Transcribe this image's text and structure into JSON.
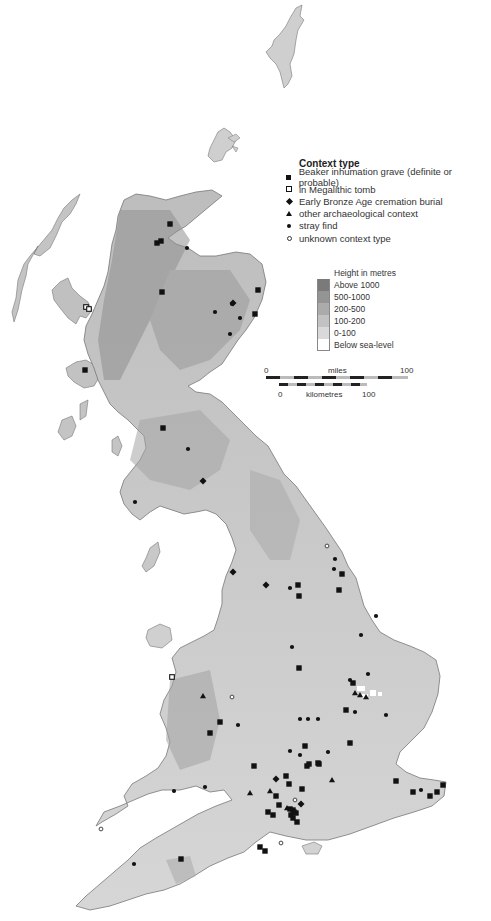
{
  "legend": {
    "title": "Context type",
    "items": [
      {
        "symbol": "filled-square",
        "label": "Beaker inhumation grave (definite or probable)"
      },
      {
        "symbol": "open-square",
        "label": "in Megalithic tomb"
      },
      {
        "symbol": "filled-diamond",
        "label": "Early Bronze Age cremation burial"
      },
      {
        "symbol": "filled-triangle",
        "label": "other archaeological context"
      },
      {
        "symbol": "filled-dot",
        "label": "stray find"
      },
      {
        "symbol": "open-dot",
        "label": "unknown context type"
      }
    ]
  },
  "height_legend": {
    "title": "Height in metres",
    "bands": [
      {
        "label": "Above 1000",
        "color": "#7a7a7a"
      },
      {
        "label": "500-1000",
        "color": "#949494"
      },
      {
        "label": "200-500",
        "color": "#ababab"
      },
      {
        "label": "100-200",
        "color": "#c2c2c2"
      },
      {
        "label": "0-100",
        "color": "#d9d9d9"
      },
      {
        "label": "Below sea-level",
        "color": "#ffffff"
      }
    ]
  },
  "scale_bar": {
    "miles_label": "miles",
    "miles_start": "0",
    "miles_end": "100",
    "km_label": "kilometres",
    "km_start": "0",
    "km_end": "100"
  },
  "colors": {
    "land": "#d3d3d3",
    "highland": "#a8a8a8",
    "coast": "#777777",
    "marker": "#111111",
    "sea": "#ffffff"
  },
  "markers": {
    "beaker_inhumation": [
      [
        170,
        224
      ],
      [
        157,
        243
      ],
      [
        161,
        241
      ],
      [
        162,
        292
      ],
      [
        258,
        290
      ],
      [
        255,
        314
      ],
      [
        85,
        370
      ],
      [
        163,
        428
      ],
      [
        299,
        596
      ],
      [
        342,
        574
      ],
      [
        339,
        590
      ],
      [
        299,
        668
      ],
      [
        353,
        683
      ],
      [
        346,
        710
      ],
      [
        350,
        743
      ],
      [
        305,
        746
      ],
      [
        307,
        766
      ],
      [
        309,
        764
      ],
      [
        318,
        763
      ],
      [
        319,
        764
      ],
      [
        302,
        789
      ],
      [
        254,
        766
      ],
      [
        289,
        784
      ],
      [
        286,
        776
      ],
      [
        276,
        796
      ],
      [
        268,
        812
      ],
      [
        279,
        805
      ],
      [
        273,
        815
      ],
      [
        290,
        809
      ],
      [
        293,
        810
      ],
      [
        294,
        812
      ],
      [
        296,
        813
      ],
      [
        291,
        815
      ],
      [
        293,
        818
      ],
      [
        297,
        822
      ],
      [
        396,
        781
      ],
      [
        413,
        792
      ],
      [
        430,
        796
      ],
      [
        437,
        792
      ],
      [
        443,
        785
      ],
      [
        260,
        847
      ],
      [
        265,
        851
      ],
      [
        181,
        859
      ],
      [
        298,
        585
      ],
      [
        210,
        733
      ],
      [
        220,
        722
      ]
    ],
    "megalithic_tomb": [
      [
        86,
        307
      ],
      [
        89,
        309
      ],
      [
        172,
        677
      ]
    ],
    "cremation": [
      [
        203,
        481
      ],
      [
        233,
        572
      ],
      [
        301,
        804
      ],
      [
        276,
        779
      ],
      [
        233,
        303
      ],
      [
        266,
        585
      ]
    ],
    "other_context": [
      [
        355,
        693
      ],
      [
        360,
        695
      ],
      [
        366,
        697
      ],
      [
        203,
        696
      ],
      [
        332,
        780
      ],
      [
        250,
        793
      ],
      [
        287,
        808
      ],
      [
        270,
        791
      ]
    ],
    "stray_find": [
      [
        187,
        248
      ],
      [
        188,
        449
      ],
      [
        135,
        502
      ],
      [
        335,
        559
      ],
      [
        334,
        569
      ],
      [
        290,
        588
      ],
      [
        376,
        616
      ],
      [
        292,
        647
      ],
      [
        361,
        635
      ],
      [
        368,
        674
      ],
      [
        350,
        680
      ],
      [
        328,
        752
      ],
      [
        318,
        719
      ],
      [
        290,
        751
      ],
      [
        300,
        719
      ],
      [
        308,
        719
      ],
      [
        238,
        725
      ],
      [
        355,
        712
      ],
      [
        386,
        715
      ],
      [
        300,
        755
      ],
      [
        174,
        791
      ],
      [
        421,
        790
      ],
      [
        205,
        787
      ],
      [
        134,
        864
      ],
      [
        232,
        304
      ],
      [
        215,
        312
      ],
      [
        240,
        318
      ],
      [
        230,
        334
      ]
    ],
    "unknown_context": [
      [
        327,
        546
      ],
      [
        232,
        697
      ],
      [
        295,
        800
      ],
      [
        101,
        829
      ],
      [
        281,
        843
      ]
    ]
  }
}
